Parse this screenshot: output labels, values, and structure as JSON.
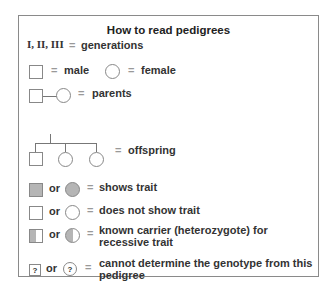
{
  "title": "How to read pedigrees",
  "generations": {
    "symbol": "I, II, III",
    "eq": "=",
    "label": "generations"
  },
  "male": {
    "eq": "=",
    "label": "male"
  },
  "female": {
    "eq": "=",
    "label": "female"
  },
  "parents": {
    "eq": "=",
    "label": "parents"
  },
  "offspring": {
    "eq": "=",
    "label": "offspring"
  },
  "shows_trait": {
    "or": "or",
    "eq": "=",
    "label": "shows trait"
  },
  "no_trait": {
    "or": "or",
    "eq": "=",
    "label": "does not show trait"
  },
  "carrier": {
    "or": "or",
    "eq": "=",
    "label_line1": "known carrier (heterozygote) for",
    "label_line2": "recessive trait"
  },
  "unknown": {
    "q": "?",
    "or": "or",
    "eq": "=",
    "label_line1": "cannot determine the genotype from this",
    "label_line2": "pedigree"
  },
  "colors": {
    "fill": "#b5b5b5",
    "border": "#888888"
  }
}
